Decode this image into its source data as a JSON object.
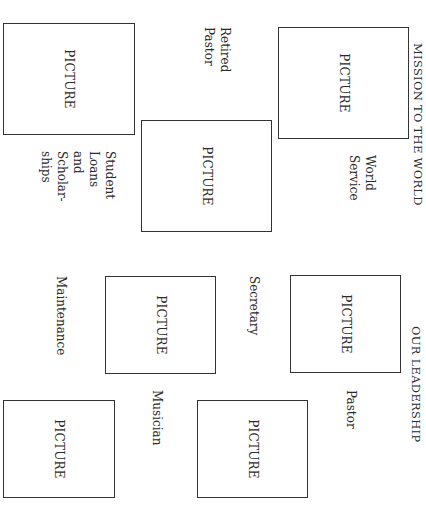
{
  "orientation": "rotated-90-clockwise",
  "sections": {
    "mission": {
      "heading": "MISSION TO THE WORLD",
      "items": [
        {
          "caption": "World Service",
          "picture": "PICTURE"
        },
        {
          "caption": "Retired Pastor",
          "picture": "PICTURE"
        },
        {
          "caption": "Student Loans and Scholar-ships",
          "picture": "PICTURE"
        }
      ],
      "captions": {
        "world_service": [
          "World",
          "Service"
        ],
        "retired_pastor": [
          "Retired",
          "Pastor"
        ],
        "student_loans": [
          "Student",
          "Loans",
          "and",
          "Scholar-",
          "ships"
        ]
      }
    },
    "leadership": {
      "heading": "OUR LEADERSHIP",
      "items": [
        {
          "caption": "Pastor",
          "picture": "PICTURE"
        },
        {
          "caption": "Secretary",
          "picture": "PICTURE"
        },
        {
          "caption": "Musician",
          "picture": "PICTURE"
        },
        {
          "caption": "Maintenance",
          "picture": "PICTURE"
        }
      ]
    }
  },
  "placeholder_label": "PICTURE"
}
